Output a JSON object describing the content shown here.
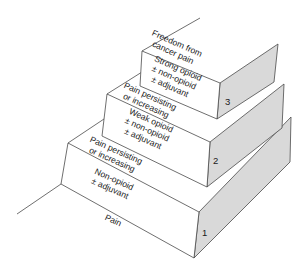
{
  "diagram": {
    "type": "staircase",
    "colors": {
      "side_face": "#d9d9d9",
      "front_face": "#ffffff",
      "edge": "#4a4a4a"
    },
    "floor_label": "Pain",
    "top_label": [
      "Freedom from",
      "cancer pain"
    ],
    "steps": [
      {
        "number": "1",
        "treatment": [
          "Non-opioid",
          "± adjuvant"
        ],
        "transition": [
          "Pain persisting",
          "or increasing"
        ]
      },
      {
        "number": "2",
        "treatment": [
          "Weak opioid",
          "± non-opioid",
          "± adjuvant"
        ],
        "transition": [
          "Pain persisting",
          "or increasing"
        ]
      },
      {
        "number": "3",
        "treatment": [
          "Strong opioid",
          "± non-opioid",
          "± adjuvant"
        ]
      }
    ]
  }
}
